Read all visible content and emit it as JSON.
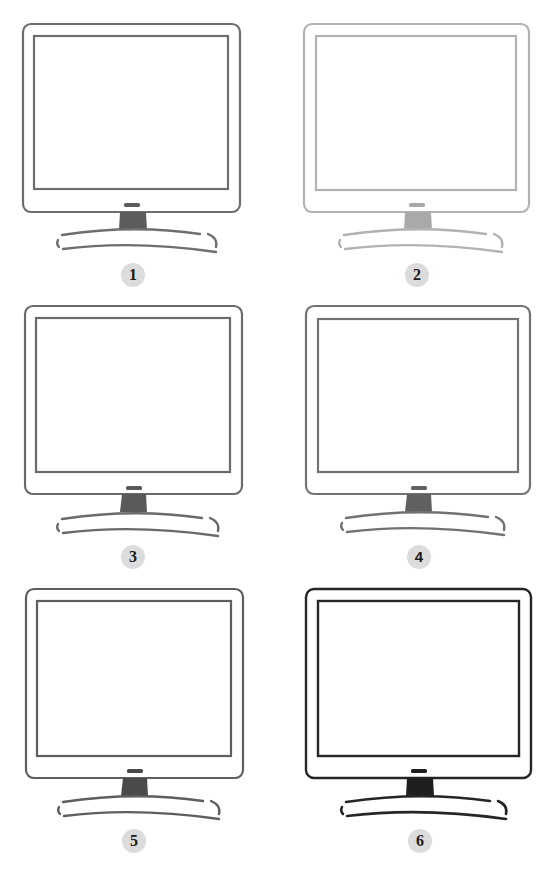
{
  "figure": {
    "badge_fill": "#dcdcdc",
    "monitors": [
      {
        "label": "1",
        "stroke": "#6e6e6e",
        "stand": "#5c5c5c",
        "badge_font": "serif"
      },
      {
        "label": "2",
        "stroke": "#b2b2b2",
        "stand": "#a9a9a9",
        "badge_font": "serif"
      },
      {
        "label": "3",
        "stroke": "#6a6a6a",
        "stand": "#5a5a5a",
        "badge_font": "serif"
      },
      {
        "label": "4",
        "stroke": "#727272",
        "stand": "#606060",
        "badge_font": "sans"
      },
      {
        "label": "5",
        "stroke": "#5e5e5e",
        "stand": "#4a4a4a",
        "badge_font": "serif"
      },
      {
        "label": "6",
        "stroke": "#262626",
        "stand": "#1f1f1f",
        "badge_font": "serif"
      }
    ]
  }
}
